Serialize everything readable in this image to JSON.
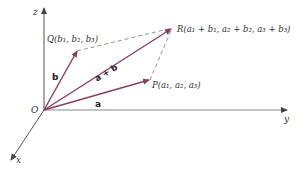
{
  "diagram": {
    "type": "vector-addition-3d",
    "colors": {
      "axis": "#555555",
      "vector": "#8a3f5c",
      "dashed": "#888888",
      "text": "#333333"
    },
    "axes": {
      "z_label": "z",
      "y_label": "y",
      "x_label": "x",
      "origin_label": "O"
    },
    "vectors": {
      "a": {
        "label": "a"
      },
      "b": {
        "label": "b"
      },
      "sum": {
        "label": "a + b"
      }
    },
    "points": {
      "P": {
        "name": "P",
        "coords": "(a",
        "text": "P(a₁, a₂, a₃)"
      },
      "Q": {
        "text": "Q(b₁, b₂, b₃)"
      },
      "R": {
        "text": "R(a₁ + b₁, a₂ + b₂, a₃ + b₃)"
      }
    }
  }
}
